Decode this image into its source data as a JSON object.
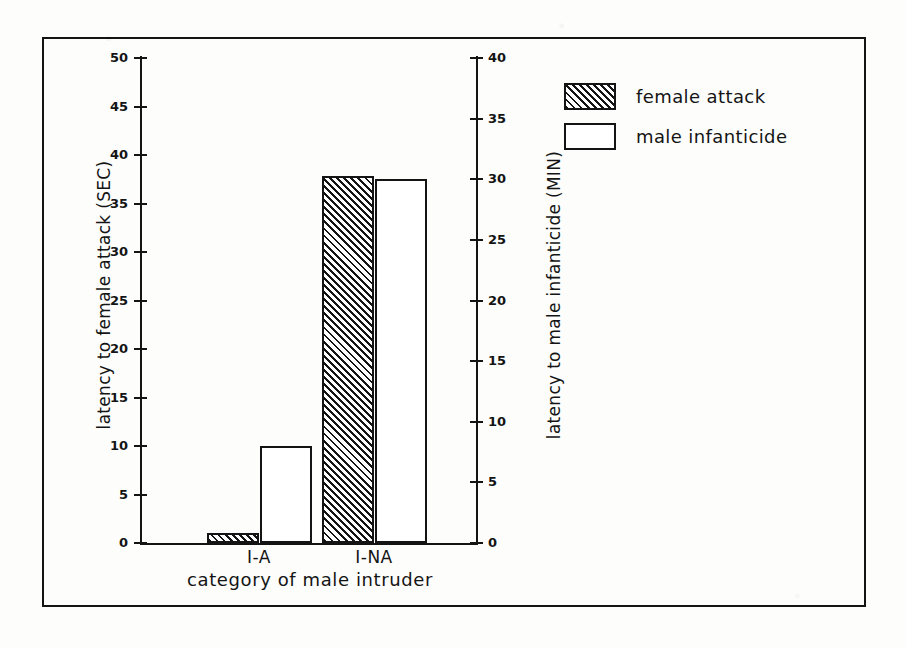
{
  "figure": {
    "frame_border_color": "#141414",
    "background_color": "#fdfdfc"
  },
  "legend": {
    "position": "top-right",
    "entries": [
      {
        "label": "female attack",
        "swatch": "hatched",
        "color": "#141414"
      },
      {
        "label": "male infanticide",
        "swatch": "open",
        "color": "#ffffff"
      }
    ]
  },
  "chart_data": {
    "type": "bar",
    "title": "",
    "xlabel": "category of male intruder",
    "categories": [
      "I-A",
      "I-NA"
    ],
    "grid": false,
    "legend_position": "top-right",
    "axes": {
      "left": {
        "label": "latency to female attack (SEC)",
        "unit": "SEC",
        "ylim": [
          0,
          50
        ],
        "ticks": [
          0,
          5,
          10,
          15,
          20,
          25,
          30,
          35,
          40,
          45,
          50
        ],
        "tick_labels": [
          "0",
          "5",
          "10",
          "15",
          "20",
          "25",
          "30",
          "35",
          "40",
          "45",
          "50"
        ]
      },
      "right": {
        "label": "latency to male infanticide (MIN)",
        "unit": "MIN",
        "ylim": [
          0,
          40
        ],
        "ticks": [
          0,
          5,
          10,
          15,
          20,
          25,
          30,
          35,
          40
        ],
        "tick_labels": [
          "0",
          "5",
          "10",
          "15",
          "20",
          "25",
          "30",
          "35",
          "40"
        ]
      }
    },
    "series": [
      {
        "name": "female attack",
        "axis": "left",
        "fill": "hatched",
        "values": [
          1,
          37.8
        ]
      },
      {
        "name": "male infanticide",
        "axis": "right",
        "fill": "open",
        "values": [
          8,
          30
        ]
      }
    ]
  },
  "ghost_text": {
    "g1": "",
    "g2": "",
    "g3": "",
    "g4": "",
    "g5": ""
  }
}
